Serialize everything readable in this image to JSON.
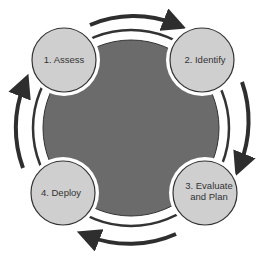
{
  "diagram": {
    "type": "cycle",
    "colors": {
      "center_fill": "#6b6b6b",
      "node_fill": "#cfcfcf",
      "stroke": "#333333",
      "arrow": "#2e2e2e",
      "background": "#ffffff"
    },
    "nodes": [
      {
        "id": "assess",
        "lines": [
          "1. Assess"
        ]
      },
      {
        "id": "identify",
        "lines": [
          "2. Identify"
        ]
      },
      {
        "id": "evaluate-and-plan",
        "lines": [
          "3. Evaluate",
          "and Plan"
        ]
      },
      {
        "id": "deploy",
        "lines": [
          "4. Deploy"
        ]
      }
    ],
    "flow": "clockwise"
  }
}
